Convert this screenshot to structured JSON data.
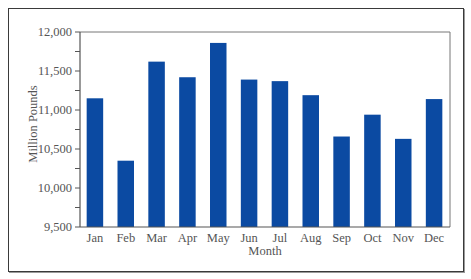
{
  "chart_data": {
    "type": "bar",
    "title": "",
    "xlabel": "Month",
    "ylabel": "Million Pounds",
    "categories": [
      "Jan",
      "Feb",
      "Mar",
      "Apr",
      "May",
      "Jun",
      "Jul",
      "Aug",
      "Sep",
      "Oct",
      "Nov",
      "Dec"
    ],
    "values": [
      11150,
      10350,
      11620,
      11420,
      11860,
      11390,
      11370,
      11190,
      10660,
      10940,
      10630,
      11140
    ],
    "ylim": [
      9500,
      12000
    ],
    "yticks": [
      9500,
      10000,
      10500,
      11000,
      11500,
      12000
    ],
    "ytick_labels": [
      "9,500",
      "10,000",
      "10,500",
      "11,000",
      "11,500",
      "12,000"
    ],
    "grid": false,
    "legend": null,
    "bar_color": "#0b4aa2"
  }
}
